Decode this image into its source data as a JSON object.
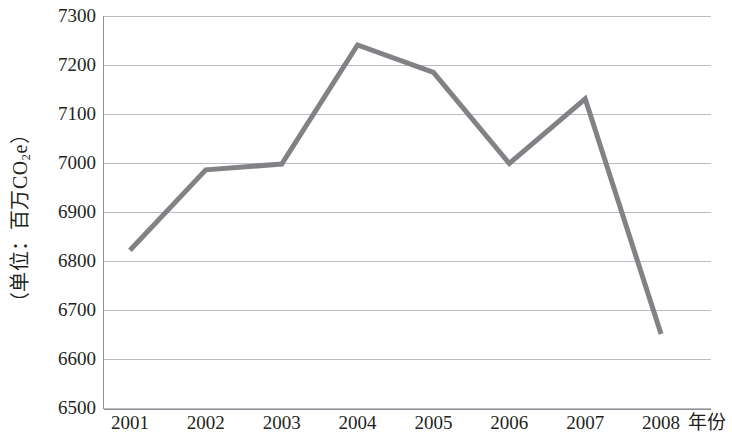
{
  "chart_data": {
    "type": "line",
    "title": "",
    "xlabel": "年份",
    "ylabel": "（单位：百万CO₂e）",
    "categories": [
      "2001",
      "2002",
      "2003",
      "2004",
      "2005",
      "2006",
      "2007",
      "2008"
    ],
    "values": [
      6822,
      6986,
      6998,
      7241,
      7185,
      6999,
      7131,
      6651
    ],
    "series": [
      {
        "name": "",
        "values": [
          6822,
          6986,
          6998,
          7241,
          7185,
          6999,
          7131,
          6651
        ]
      }
    ],
    "ylim": [
      6500,
      7300
    ],
    "ytick_labels": [
      "7300",
      "7200",
      "7100",
      "7000",
      "6900",
      "6800",
      "6700",
      "6600",
      "6500"
    ],
    "ytick_values": [
      7300,
      7200,
      7100,
      7000,
      6900,
      6800,
      6700,
      6600,
      6500
    ],
    "xtick_labels": [
      "2001",
      "2002",
      "2003",
      "2004",
      "2005",
      "2006",
      "2007",
      "2008"
    ],
    "grid": true,
    "grid_axis": "y",
    "legend": false,
    "legend_position": "none",
    "line_color": "#808285",
    "grid_color": "#b9bcc0",
    "axis_color": "#8d9094",
    "background_color": "#ffffff",
    "line_width": 5,
    "markers": false
  },
  "y_axis": {
    "title_prefix": "（单位：百万CO",
    "title_sub": "2",
    "title_suffix": "e）"
  }
}
